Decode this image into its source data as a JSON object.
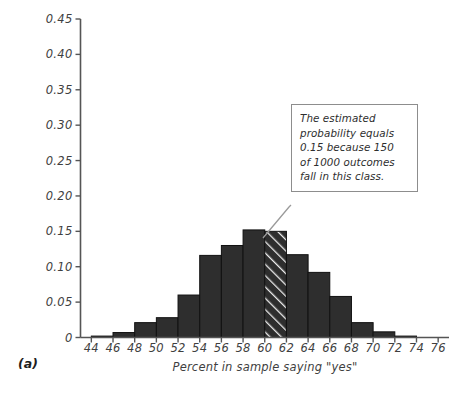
{
  "panel": {
    "label": "(a)"
  },
  "annotation": {
    "text": "The estimated probability equals 0.15 because 150 of 1000 outcomes fall in this class.",
    "line1": "The estimated",
    "line2": "probability equals",
    "line3": "0.15 because 150",
    "line4": "of 1000 outcomes",
    "line5": "fall in this class."
  },
  "colors": {
    "bar_fill": "#2e2e2e",
    "bar_edge": "#111111",
    "hatch_line": "#e9e9e9",
    "axis": "#555555",
    "text": "#3f3f3f",
    "annotation_border": "#8d8d8d",
    "leader_line": "#9a9a9a",
    "background": "#ffffff"
  },
  "chart_data": {
    "type": "bar",
    "title": "",
    "subtitle": "",
    "xlabel": "Percent in sample saying \"yes\"",
    "ylabel": "Probability",
    "xlim": [
      43,
      77
    ],
    "ylim": [
      0,
      0.45
    ],
    "grid": false,
    "legend": null,
    "bin_width": 2,
    "xticks": [
      44,
      46,
      48,
      50,
      52,
      54,
      56,
      58,
      60,
      62,
      64,
      66,
      68,
      70,
      72,
      74,
      76
    ],
    "xtick_labels": [
      "44",
      "46",
      "48",
      "50",
      "52",
      "54",
      "56",
      "58",
      "60",
      "62",
      "64",
      "66",
      "68",
      "70",
      "72",
      "74",
      "76"
    ],
    "yticks": [
      0,
      0.05,
      0.1,
      0.15,
      0.2,
      0.25,
      0.3,
      0.35,
      0.4,
      0.45
    ],
    "ytick_labels": [
      "0",
      "0.05",
      "0.10",
      "0.15",
      "0.20",
      "0.25",
      "0.30",
      "0.35",
      "0.40",
      "0.45"
    ],
    "categories": [
      "44-46",
      "46-48",
      "48-50",
      "50-52",
      "52-54",
      "54-56",
      "56-58",
      "58-60",
      "60-62",
      "62-64",
      "64-66",
      "66-68",
      "68-70",
      "70-72",
      "72-74"
    ],
    "bin_starts": [
      44,
      46,
      48,
      50,
      52,
      54,
      56,
      58,
      60,
      62,
      64,
      66,
      68,
      70,
      72
    ],
    "values": [
      0.002,
      0.007,
      0.021,
      0.028,
      0.06,
      0.116,
      0.13,
      0.152,
      0.15,
      0.117,
      0.092,
      0.058,
      0.021,
      0.008,
      0.002
    ],
    "highlighted_bin": "60-62",
    "highlighted_index": 8,
    "highlighted_value": 0.15,
    "highlight_style": "diagonal-hatch",
    "annotations": [
      {
        "text": "The estimated probability equals 0.15 because 150 of 1000 outcomes fall in this class.",
        "points_to_bin": "60-62"
      }
    ]
  }
}
